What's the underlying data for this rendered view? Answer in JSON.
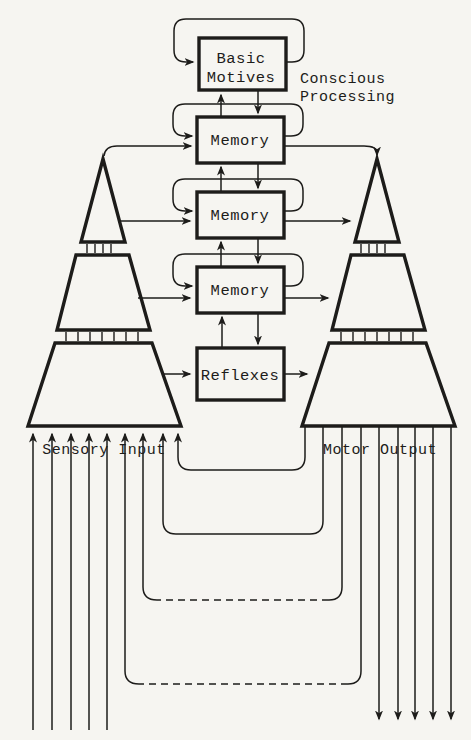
{
  "diagram": {
    "boxes": [
      {
        "id": "basic-motives",
        "line1": "Basic",
        "line2": "Motives"
      },
      {
        "id": "memory-upper",
        "label": "Memory"
      },
      {
        "id": "memory-middle",
        "label": "Memory"
      },
      {
        "id": "memory-lower",
        "label": "Memory"
      },
      {
        "id": "reflexes",
        "label": "Reflexes"
      }
    ],
    "annotations": {
      "conscious_processing_line1": "Conscious",
      "conscious_processing_line2": "Processing",
      "sensory_input": "Sensory Input",
      "motor_output": "Motor Output"
    },
    "colors": {
      "ink": "#1d1c1a",
      "paper": "#f6f5f1"
    }
  }
}
